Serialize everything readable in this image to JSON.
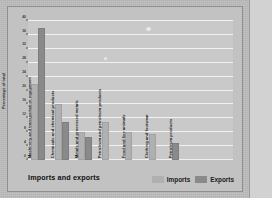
{
  "figure": {
    "title": "Imports and exports",
    "background_color": "#c2c2c2",
    "plot_background_color": "#c9c9c9",
    "gridline_color": "#f2f2f2"
  },
  "legend": {
    "position": "bottom-right",
    "items": [
      {
        "label": "Imports",
        "color": "#b0b0b0"
      },
      {
        "label": "Exports",
        "color": "#8a8a8a"
      }
    ]
  },
  "yaxis": {
    "label": "Percentage of total",
    "ticks": [
      "0",
      "4",
      "8",
      "12",
      "16",
      "20",
      "24",
      "28",
      "32",
      "36",
      "40"
    ]
  },
  "chart_data": {
    "type": "bar",
    "title": "Imports and exports",
    "xlabel": "",
    "ylabel": "Percentage of total",
    "ylim": [
      0,
      40
    ],
    "ytick_step": 4,
    "grid": true,
    "legend_position": "bottom-right",
    "categories": [
      "Machinery and transportation equipment",
      "Chemicals and chemical products",
      "Metals and processed metals",
      "Petroleum and petroleum products",
      "Food and live animals",
      "Clothing and footwear",
      "Petroleum products"
    ],
    "series": [
      {
        "name": "Imports",
        "color": "#b0b0b0",
        "values": [
          22,
          16,
          8,
          11,
          8,
          7.5,
          0
        ]
      },
      {
        "name": "Exports",
        "color": "#8a8a8a",
        "values": [
          38,
          11,
          6.5,
          0,
          0,
          0,
          5
        ]
      }
    ]
  }
}
